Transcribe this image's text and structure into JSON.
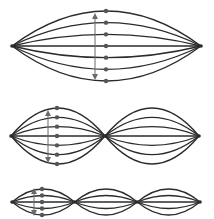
{
  "diagram": {
    "colors": {
      "string": "#2b2b2b",
      "dot": "#555555",
      "arrow": "#6a6a6a",
      "background": "#ffffff"
    },
    "rows": [
      {
        "name": "fundamental",
        "loops": 1,
        "y": 46,
        "x_start": 12,
        "x_end": 201,
        "amplitude": 35,
        "lines": 7,
        "dots_x": 106,
        "arrow_x": 95,
        "arrow_y1": 16,
        "arrow_y2": 77
      },
      {
        "name": "second-harmonic",
        "loops": 2,
        "y": 136,
        "x_start": 11,
        "x_end": 199,
        "amplitude": 28,
        "lines": 7,
        "dots_x": 57,
        "arrow_x": 48,
        "arrow_y1": 113,
        "arrow_y2": 160
      },
      {
        "name": "third-harmonic",
        "loops": 3,
        "y": 202,
        "x_start": 12,
        "x_end": 200,
        "amplitude": 13,
        "lines": 5,
        "dots_x": 42,
        "arrow_x": 34,
        "arrow_y1": 191,
        "arrow_y2": 213
      }
    ]
  }
}
